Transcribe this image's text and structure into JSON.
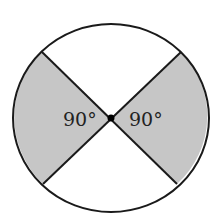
{
  "diagram": {
    "type": "circle divided by two intersecting diameters",
    "shaded_sectors": [
      "left",
      "right"
    ],
    "unshaded_sectors": [
      "top",
      "bottom"
    ],
    "labels": {
      "left_angle": "90°",
      "right_angle": "90°"
    },
    "colors": {
      "shade": "#c6c6c6",
      "stroke": "#1a1a1a",
      "background": "#ffffff"
    }
  }
}
